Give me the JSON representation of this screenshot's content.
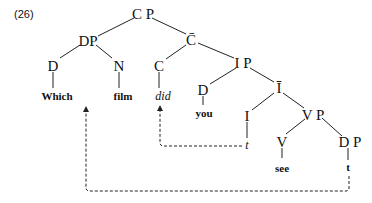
{
  "example_number": "(26)",
  "nodes": {
    "cp": "C P",
    "dp": "DP",
    "cbar": "C̄",
    "d_which": "D",
    "n_film": "N",
    "c_did": "C",
    "ip": "I P",
    "d_you": "D",
    "ibar": "Ī",
    "i": "I",
    "vp": "V P",
    "v": "V",
    "dp_obj": "D P"
  },
  "words": {
    "which": "Which",
    "film": "film",
    "did": "did",
    "you": "you",
    "i_trace": "t",
    "see": "see",
    "dp_trace": "t"
  },
  "movements": [
    {
      "from": "I trace t",
      "to": "did"
    },
    {
      "from": "DP trace t",
      "to": "Which film"
    }
  ]
}
